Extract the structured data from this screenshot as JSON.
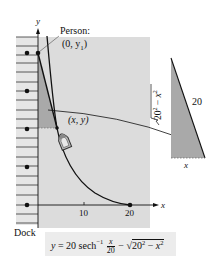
{
  "diagram": {
    "axes": {
      "y_label": "y",
      "x_label": "x",
      "x_ticks": [
        {
          "value": "10",
          "px": 84
        },
        {
          "value": "20",
          "px": 130
        }
      ]
    },
    "labels": {
      "person_title": "Person:",
      "person_point": "(0, y",
      "person_sub": "1",
      "person_close": ")",
      "boat_point": "(x, y)",
      "dock": "Dock"
    },
    "triangle": {
      "hypotenuse": "20",
      "base": "x",
      "side": "√(20² − x²)",
      "side_radicand_a": "20",
      "side_radicand_b": "x"
    },
    "formula": {
      "lhs": "y = 20 sech",
      "inverse": "−1",
      "frac_num": "x",
      "frac_den": "20",
      "minus": " − ",
      "sqrt_a": "20",
      "sqrt_b": "x",
      "text": "y = 20 sech⁻¹(x/20) − √(20² − x²)"
    },
    "colors": {
      "panel": "#dcdcdc",
      "dock": "#e4e4e4",
      "shade": "#a9a9a9",
      "ink": "#111111"
    }
  }
}
